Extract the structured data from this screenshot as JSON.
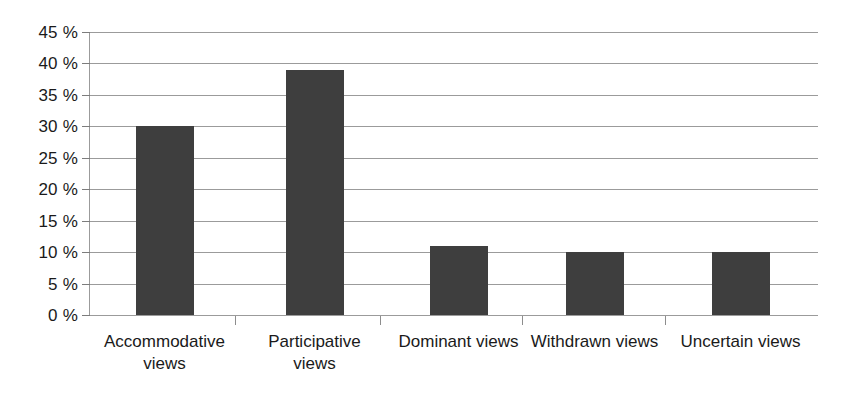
{
  "chart_data": {
    "type": "bar",
    "title": "",
    "subtitle": "",
    "xlabel": "",
    "ylabel": "",
    "categories": [
      "Accommodative views",
      "Participative views",
      "Dominant views",
      "Withdrawn views",
      "Uncertain views"
    ],
    "values": [
      30,
      39,
      11,
      10,
      10
    ],
    "value_unit": "%",
    "ylim": [
      0,
      45
    ],
    "ytick_values": [
      0,
      5,
      10,
      15,
      20,
      25,
      30,
      35,
      40,
      45
    ],
    "ytick_labels": [
      "0 %",
      "5 %",
      "10 %",
      "15 %",
      "20 %",
      "25 %",
      "30 %",
      "35 %",
      "40 %",
      "45 %"
    ],
    "grid": true,
    "grid_axis": "y",
    "legend": false,
    "legend_position": "none",
    "bar_color": "#3e3e3e",
    "grid_color": "#9b9b9b",
    "axis_color": "#9b9b9b",
    "background_color": "#ffffff",
    "text_color": "#1a1a1a",
    "series": [
      {
        "name": "Share of respondents",
        "values": [
          30,
          39,
          11,
          10,
          10
        ]
      }
    ]
  }
}
